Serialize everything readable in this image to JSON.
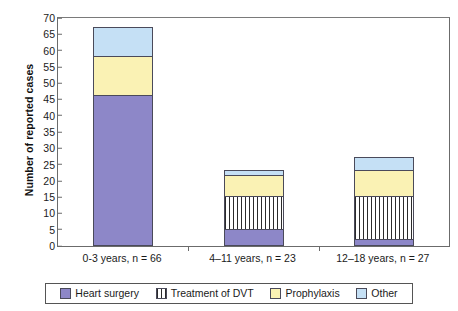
{
  "chart_data": {
    "type": "bar",
    "subtype": "stacked-bar",
    "title": "",
    "xlabel": "",
    "ylabel": "Number of reported cases",
    "ylim": [
      0,
      70
    ],
    "ytick_step": 5,
    "yticks": [
      0,
      5,
      10,
      15,
      20,
      25,
      30,
      35,
      40,
      45,
      50,
      55,
      60,
      65,
      70
    ],
    "grid": false,
    "legend_position": "bottom",
    "categories": [
      "0-3 years, n = 66",
      "4–11 years, n = 23",
      "12–18 years, n = 27"
    ],
    "series": [
      {
        "name": "Heart surgery",
        "pattern": "solid",
        "color": "#8d87c8",
        "values": [
          46,
          5,
          2
        ]
      },
      {
        "name": "Treatment of DVT",
        "pattern": "stripe",
        "color": "#ffffff",
        "values": [
          0,
          10,
          13
        ]
      },
      {
        "name": "Prophylaxis",
        "pattern": "solid",
        "color": "#faf2b4",
        "values": [
          12,
          6.5,
          8
        ]
      },
      {
        "name": "Other",
        "pattern": "solid",
        "color": "#c5e0f5",
        "values": [
          9,
          1.5,
          4
        ]
      }
    ],
    "totals": [
      67,
      23,
      27
    ]
  },
  "axis": {
    "y_title": "Number of reported cases"
  },
  "legend": {
    "items": [
      {
        "label": "Heart surgery",
        "icon": "swatch-purple-icon"
      },
      {
        "label": "Treatment of DVT",
        "icon": "swatch-striped-icon"
      },
      {
        "label": "Prophylaxis",
        "icon": "swatch-yellow-icon"
      },
      {
        "label": "Other",
        "icon": "swatch-blue-icon"
      }
    ]
  }
}
